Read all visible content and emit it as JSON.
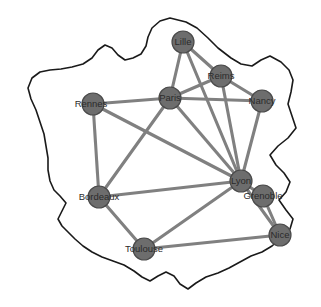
{
  "figure": {
    "kind": "network-graph-on-map",
    "region_outline_name": "France"
  },
  "chart_data": {
    "type": "scatter",
    "title": "",
    "subtitle": "",
    "xlabel": "",
    "ylabel": "",
    "legend": [],
    "grid": false,
    "xlim": [
      0,
      321
    ],
    "ylim": [
      0,
      307
    ],
    "node_color": "#6d6d6d",
    "node_stroke_color": "#4a4a4a",
    "edge_color": "#808080",
    "outline_color": "#1a1a1a",
    "background_color": "#ffffff",
    "node_radius": 11,
    "nodes": [
      {
        "id": "lille",
        "label": "Lille",
        "x": 183,
        "y": 42,
        "label_dx": 0,
        "label_dy": 0
      },
      {
        "id": "reims",
        "label": "Reims",
        "x": 221,
        "y": 76,
        "label_dx": 0,
        "label_dy": 0
      },
      {
        "id": "paris",
        "label": "Paris",
        "x": 170,
        "y": 98,
        "label_dx": 0,
        "label_dy": 0
      },
      {
        "id": "nancy",
        "label": "Nancy",
        "x": 262,
        "y": 101,
        "label_dx": 0,
        "label_dy": 0
      },
      {
        "id": "rennes",
        "label": "Rennes",
        "x": 93,
        "y": 104,
        "label_dx": -2,
        "label_dy": 0
      },
      {
        "id": "lyon",
        "label": "Lyon",
        "x": 241,
        "y": 181,
        "label_dx": 0,
        "label_dy": 0
      },
      {
        "id": "grenoble",
        "label": "Grenoble",
        "x": 263,
        "y": 196,
        "label_dx": 0,
        "label_dy": 0
      },
      {
        "id": "bordeaux",
        "label": "Bordeaux",
        "x": 99,
        "y": 197,
        "label_dx": 0,
        "label_dy": 0
      },
      {
        "id": "nice",
        "label": "Nice",
        "x": 280,
        "y": 235,
        "label_dx": 0,
        "label_dy": 0
      },
      {
        "id": "toulouse",
        "label": "Toulouse",
        "x": 144,
        "y": 249,
        "label_dx": 0,
        "label_dy": 0
      }
    ],
    "edges": [
      {
        "source": "lille",
        "target": "paris"
      },
      {
        "source": "lille",
        "target": "reims"
      },
      {
        "source": "lille",
        "target": "lyon"
      },
      {
        "source": "reims",
        "target": "paris"
      },
      {
        "source": "reims",
        "target": "nancy"
      },
      {
        "source": "reims",
        "target": "lyon"
      },
      {
        "source": "paris",
        "target": "rennes"
      },
      {
        "source": "paris",
        "target": "nancy"
      },
      {
        "source": "paris",
        "target": "lyon"
      },
      {
        "source": "paris",
        "target": "bordeaux"
      },
      {
        "source": "nancy",
        "target": "lyon"
      },
      {
        "source": "rennes",
        "target": "bordeaux"
      },
      {
        "source": "rennes",
        "target": "lyon"
      },
      {
        "source": "bordeaux",
        "target": "lyon"
      },
      {
        "source": "bordeaux",
        "target": "toulouse"
      },
      {
        "source": "lyon",
        "target": "grenoble"
      },
      {
        "source": "lyon",
        "target": "nice"
      },
      {
        "source": "lyon",
        "target": "toulouse"
      },
      {
        "source": "grenoble",
        "target": "nice"
      },
      {
        "source": "toulouse",
        "target": "nice"
      }
    ],
    "outline_points": [
      [
        170,
        18
      ],
      [
        186,
        22
      ],
      [
        197,
        28
      ],
      [
        208,
        38
      ],
      [
        218,
        48
      ],
      [
        231,
        58
      ],
      [
        241,
        64
      ],
      [
        252,
        66
      ],
      [
        261,
        60
      ],
      [
        270,
        56
      ],
      [
        281,
        62
      ],
      [
        289,
        70
      ],
      [
        293,
        80
      ],
      [
        291,
        92
      ],
      [
        288,
        104
      ],
      [
        292,
        116
      ],
      [
        296,
        128
      ],
      [
        288,
        138
      ],
      [
        278,
        146
      ],
      [
        270,
        155
      ],
      [
        276,
        165
      ],
      [
        284,
        173
      ],
      [
        290,
        182
      ],
      [
        286,
        192
      ],
      [
        279,
        200
      ],
      [
        286,
        210
      ],
      [
        293,
        219
      ],
      [
        290,
        229
      ],
      [
        281,
        238
      ],
      [
        272,
        246
      ],
      [
        262,
        252
      ],
      [
        251,
        256
      ],
      [
        240,
        262
      ],
      [
        229,
        268
      ],
      [
        218,
        273
      ],
      [
        206,
        277
      ],
      [
        196,
        283
      ],
      [
        188,
        289
      ],
      [
        180,
        284
      ],
      [
        174,
        276
      ],
      [
        166,
        272
      ],
      [
        158,
        276
      ],
      [
        150,
        281
      ],
      [
        142,
        277
      ],
      [
        134,
        271
      ],
      [
        124,
        265
      ],
      [
        113,
        261
      ],
      [
        102,
        257
      ],
      [
        92,
        252
      ],
      [
        83,
        246
      ],
      [
        75,
        239
      ],
      [
        68,
        232
      ],
      [
        62,
        226
      ],
      [
        58,
        219
      ],
      [
        62,
        211
      ],
      [
        66,
        203
      ],
      [
        60,
        196
      ],
      [
        54,
        190
      ],
      [
        50,
        181
      ],
      [
        48,
        170
      ],
      [
        48,
        158
      ],
      [
        46,
        146
      ],
      [
        44,
        134
      ],
      [
        40,
        122
      ],
      [
        36,
        110
      ],
      [
        31,
        99
      ],
      [
        28,
        88
      ],
      [
        32,
        78
      ],
      [
        40,
        72
      ],
      [
        50,
        70
      ],
      [
        61,
        69
      ],
      [
        72,
        67
      ],
      [
        83,
        64
      ],
      [
        92,
        58
      ],
      [
        98,
        50
      ],
      [
        105,
        45
      ],
      [
        112,
        48
      ],
      [
        118,
        55
      ],
      [
        125,
        60
      ],
      [
        133,
        58
      ],
      [
        141,
        54
      ],
      [
        146,
        46
      ],
      [
        148,
        37
      ],
      [
        152,
        28
      ],
      [
        160,
        21
      ]
    ]
  }
}
